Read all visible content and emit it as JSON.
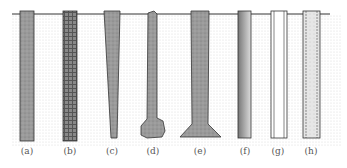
{
  "diagram": {
    "ground_line": {
      "x1": 12,
      "x2": 330,
      "y": 14
    },
    "colors": {
      "soil_dots": "#d4d4d4",
      "pile_fill": "#9a9a9a",
      "outline": "#333333",
      "steel_gradient_dark": "#777777",
      "steel_gradient_light": "#dcdcdc"
    },
    "piles": [
      {
        "id": "a",
        "label": "(a)",
        "type": "concrete-prismatic",
        "label_x": 27
      },
      {
        "id": "b",
        "label": "(b)",
        "type": "reinforced-precast",
        "label_x": 70
      },
      {
        "id": "c",
        "label": "(c)",
        "type": "tapered",
        "label_x": 112
      },
      {
        "id": "d",
        "label": "(d)",
        "type": "bulb-base",
        "label_x": 153
      },
      {
        "id": "e",
        "label": "(e)",
        "type": "belled",
        "label_x": 200
      },
      {
        "id": "f",
        "label": "(f)",
        "type": "steel",
        "label_x": 245
      },
      {
        "id": "g",
        "label": "(g)",
        "type": "pipe-open",
        "label_x": 278
      },
      {
        "id": "h",
        "label": "(h)",
        "type": "pipe-concrete-filled",
        "label_x": 311
      }
    ]
  }
}
